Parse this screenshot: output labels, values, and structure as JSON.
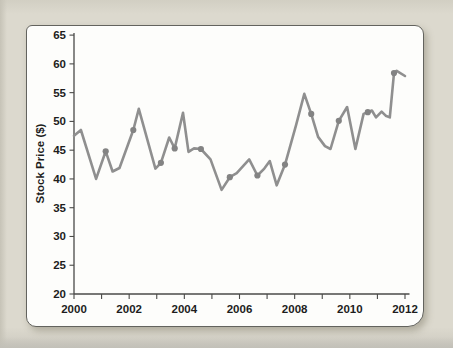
{
  "page": {
    "background_color": "#dad7cc",
    "card_background": "#fdfdfb",
    "card_border_color": "#63635e"
  },
  "chart_data": {
    "type": "line",
    "title": "",
    "xlabel": "",
    "ylabel": "Stock Price ($)",
    "xlim": [
      2000,
      2012
    ],
    "ylim": [
      20,
      65
    ],
    "x_tick_years": [
      2000,
      2001,
      2002,
      2003,
      2004,
      2005,
      2006,
      2007,
      2008,
      2009,
      2010,
      2011,
      2012
    ],
    "x_tick_labels": [
      "2000",
      "2002",
      "2004",
      "2006",
      "2008",
      "2010",
      "2012"
    ],
    "x_labeled_years": [
      2000,
      2002,
      2004,
      2006,
      2008,
      2010,
      2012
    ],
    "y_ticks": [
      20,
      25,
      30,
      35,
      40,
      45,
      50,
      55,
      60,
      65
    ],
    "grid": false,
    "legend": false,
    "line_color": "#8f8f8f",
    "marker_color": "#838383",
    "axis_color": "#4a4a48",
    "series": [
      {
        "name": "Stock Price",
        "x": [
          2000.0,
          2000.25,
          2000.8,
          2001.15,
          2001.4,
          2001.65,
          2002.15,
          2002.35,
          2002.95,
          2003.15,
          2003.45,
          2003.65,
          2003.95,
          2004.15,
          2004.35,
          2004.6,
          2004.95,
          2005.35,
          2005.65,
          2005.9,
          2006.35,
          2006.65,
          2006.9,
          2007.1,
          2007.35,
          2007.65,
          2008.05,
          2008.35,
          2008.6,
          2008.85,
          2009.1,
          2009.3,
          2009.6,
          2009.9,
          2010.2,
          2010.5,
          2010.65,
          2010.8,
          2010.95,
          2011.15,
          2011.3,
          2011.45,
          2011.6,
          2011.7,
          2012.0
        ],
        "y": [
          47.5,
          48.5,
          40.0,
          44.8,
          41.3,
          41.9,
          48.5,
          52.2,
          41.8,
          42.8,
          47.2,
          45.3,
          51.5,
          44.7,
          45.3,
          45.2,
          43.4,
          38.1,
          40.3,
          41.0,
          43.4,
          40.6,
          41.8,
          43.1,
          38.9,
          42.5,
          49.3,
          54.8,
          51.3,
          47.3,
          45.7,
          45.2,
          50.1,
          52.5,
          45.2,
          51.3,
          51.6,
          51.9,
          50.7,
          51.7,
          51.0,
          50.7,
          58.4,
          58.8,
          57.9
        ],
        "marker_indices": [
          3,
          6,
          9,
          11,
          15,
          18,
          21,
          25,
          28,
          32,
          36,
          42
        ]
      }
    ]
  }
}
